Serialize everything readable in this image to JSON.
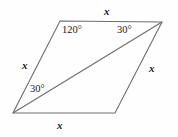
{
  "figure": {
    "type": "parallelogram-with-diagonal",
    "stroke_color": "#6e6e6e",
    "background_color": "#fefefe",
    "text_color": "#1b1b1b"
  },
  "labels": {
    "side_top": "x",
    "side_bottom": "x",
    "side_left": "x",
    "side_right": "x",
    "angle_top_left": "120°",
    "angle_top_right": "30°",
    "angle_bottom_left": "30°"
  },
  "geometry": {
    "vertices": {
      "top_left": {
        "x": 60,
        "y": 21
      },
      "top_right": {
        "x": 162,
        "y": 22
      },
      "bottom_right": {
        "x": 115,
        "y": 113
      },
      "bottom_left": {
        "x": 13,
        "y": 113
      }
    },
    "diagonal": {
      "from": "bottom_left",
      "to": "top_right"
    }
  }
}
